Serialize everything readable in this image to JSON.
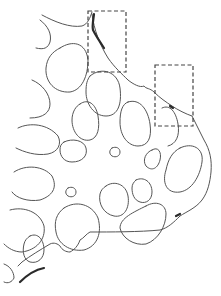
{
  "figure": {
    "type": "tissue-tracing-diagram",
    "colors": {
      "background": "#ffffff",
      "outline": "#555555",
      "thickened_edge": "#2a2a2a",
      "roi_box": "#444444"
    },
    "regions_of_interest": [
      {
        "id": "roi-1",
        "x": 88,
        "y": 11,
        "width": 38,
        "height": 61
      },
      {
        "id": "roi-2",
        "x": 155,
        "y": 65,
        "width": 38,
        "height": 61
      }
    ]
  }
}
